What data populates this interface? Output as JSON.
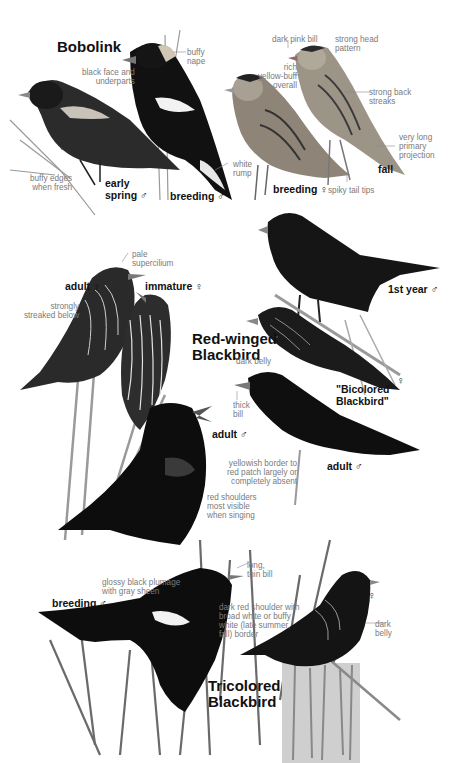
{
  "colors": {
    "background": "#ffffff",
    "title_text": "#111111",
    "annotation_text": "#7a7a7a",
    "bird_black": "#141414",
    "bobolink_buff": "#b8b0a4",
    "grass_gray": "#8a8a8a"
  },
  "species": [
    {
      "name": "Bobolink",
      "figures": [
        {
          "label": "early spring",
          "sex_symbol": "♂"
        },
        {
          "label": "breeding",
          "sex_symbol": "♂"
        },
        {
          "label": "breeding",
          "sex_symbol": "♀"
        },
        {
          "label": "fall",
          "sex_symbol": ""
        }
      ],
      "annotations": [
        {
          "text": "buffy\nnape"
        },
        {
          "text": "black face and\nunderparts"
        },
        {
          "text": "buffy edges\nwhen fresh"
        },
        {
          "text": "white\nrump"
        },
        {
          "text": "dark pink bill"
        },
        {
          "text": "strong head\npattern"
        },
        {
          "text": "rich\nyellow-buff\noverall"
        },
        {
          "text": "strong back\nstreaks"
        },
        {
          "text": "very long\nprimary\nprojection"
        },
        {
          "text": "spiky tail tips"
        }
      ]
    },
    {
      "name": "Red-winged\nBlackbird",
      "figures": [
        {
          "label": "adult",
          "sex_symbol": "♀"
        },
        {
          "label": "immature",
          "sex_symbol": "♀"
        },
        {
          "label": "1st year",
          "sex_symbol": "♂"
        },
        {
          "label": "\"Bicolored\nBlackbird\"",
          "sex_symbol": "♀"
        },
        {
          "label": "adult",
          "sex_symbol": "♂"
        },
        {
          "label": "adult",
          "sex_symbol": "♂"
        }
      ],
      "annotations": [
        {
          "text": "pale\nsupercilium"
        },
        {
          "text": "strongly\nstreaked below"
        },
        {
          "text": "dark belly"
        },
        {
          "text": "thick\nbill"
        },
        {
          "text": "yellowish border to\nred patch largely or\ncompletely absent"
        },
        {
          "text": "red shoulders\nmost visible\nwhen singing"
        }
      ]
    },
    {
      "name": "Tricolored\nBlackbird",
      "figures": [
        {
          "label": "breeding",
          "sex_symbol": "♂"
        },
        {
          "label": "",
          "sex_symbol": "♀"
        }
      ],
      "annotations": [
        {
          "text": "glossy black plumage\nwith gray sheen"
        },
        {
          "text": "long,\nthin bill"
        },
        {
          "text": "dark red shoulder with\nbroad white or buffy\nwhite (late summer,\nfall) border"
        },
        {
          "text": "dark\nbelly"
        }
      ]
    }
  ]
}
